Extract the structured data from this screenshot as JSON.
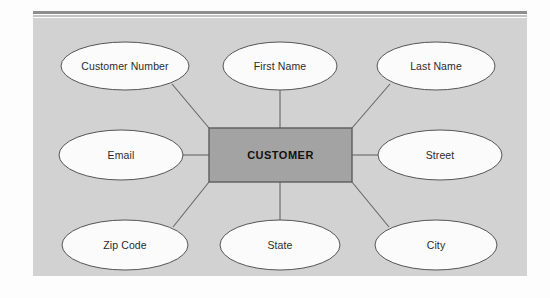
{
  "diagram": {
    "title_entity": "CUSTOMER",
    "panel_color": "#d2d2d2",
    "entity_fill": "#a3a3a3",
    "entity_stroke": "#5c5c5c",
    "attribute_fill": "#fbfbfb",
    "attribute_stroke": "#555555",
    "connector_color": "#666666",
    "rule_color": "#8e8e8e",
    "entity": {
      "label": "CUSTOMER",
      "x": 176,
      "y": 110,
      "width": 143,
      "height": 54
    },
    "attributes": [
      {
        "label": "Customer Number",
        "cx": 92,
        "cy": 48,
        "rx": 64,
        "ry": 24
      },
      {
        "label": "First Name",
        "cx": 247,
        "cy": 48,
        "rx": 57,
        "ry": 24
      },
      {
        "label": "Last Name",
        "cx": 403,
        "cy": 48,
        "rx": 59,
        "ry": 24
      },
      {
        "label": "Email",
        "cx": 88,
        "cy": 137,
        "rx": 62,
        "ry": 25
      },
      {
        "label": "Street",
        "cx": 407,
        "cy": 137,
        "rx": 62,
        "ry": 25
      },
      {
        "label": "Zip Code",
        "cx": 92,
        "cy": 227,
        "rx": 63,
        "ry": 25
      },
      {
        "label": "State",
        "cx": 247,
        "cy": 227,
        "rx": 60,
        "ry": 25
      },
      {
        "label": "City",
        "cx": 403,
        "cy": 227,
        "rx": 61,
        "ry": 25
      }
    ],
    "connectors": [
      {
        "name": "customer-number",
        "x1": 139,
        "y1": 66,
        "x2": 176,
        "y2": 110
      },
      {
        "name": "first-name",
        "x1": 247,
        "y1": 72,
        "x2": 247,
        "y2": 110
      },
      {
        "name": "last-name",
        "x1": 357,
        "y1": 66,
        "x2": 319,
        "y2": 110
      },
      {
        "name": "email",
        "x1": 150,
        "y1": 137,
        "x2": 176,
        "y2": 137
      },
      {
        "name": "street",
        "x1": 319,
        "y1": 137,
        "x2": 345,
        "y2": 137
      },
      {
        "name": "zip-code",
        "x1": 140,
        "y1": 209,
        "x2": 176,
        "y2": 164
      },
      {
        "name": "state",
        "x1": 247,
        "y1": 202,
        "x2": 247,
        "y2": 164
      },
      {
        "name": "city",
        "x1": 356,
        "y1": 209,
        "x2": 319,
        "y2": 164
      }
    ]
  }
}
